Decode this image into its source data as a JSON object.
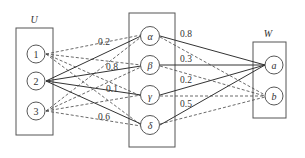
{
  "groups": {
    "U": {
      "label": "U",
      "nodes": [
        "1",
        "2",
        "3"
      ]
    },
    "M": {
      "label": "",
      "nodes": [
        "α",
        "β",
        "γ",
        "δ"
      ]
    },
    "W": {
      "label": "W",
      "nodes": [
        "a",
        "b"
      ]
    }
  },
  "edge_labels_left": [
    "0.2",
    "0.8",
    "0.1",
    "0.6"
  ],
  "edge_labels_right": [
    "0.8",
    "0.3",
    "0.2",
    "0.5"
  ],
  "edges": {
    "U_to_M_solid": [
      [
        "2",
        "α"
      ],
      [
        "2",
        "β"
      ],
      [
        "2",
        "γ"
      ],
      [
        "2",
        "δ"
      ]
    ],
    "U_to_M_dashed": [
      [
        "1",
        "α"
      ],
      [
        "1",
        "β"
      ],
      [
        "1",
        "γ"
      ],
      [
        "1",
        "δ"
      ],
      [
        "3",
        "α"
      ],
      [
        "3",
        "β"
      ],
      [
        "3",
        "γ"
      ],
      [
        "3",
        "δ"
      ]
    ],
    "M_to_W_solid": [
      [
        "α",
        "a"
      ],
      [
        "β",
        "a"
      ],
      [
        "γ",
        "a"
      ],
      [
        "δ",
        "a"
      ]
    ],
    "M_to_W_dashed": [
      [
        "α",
        "b"
      ],
      [
        "β",
        "b"
      ],
      [
        "γ",
        "b"
      ],
      [
        "δ",
        "b"
      ]
    ]
  },
  "colors": {
    "stroke": "#444444",
    "background": "#ffffff"
  }
}
